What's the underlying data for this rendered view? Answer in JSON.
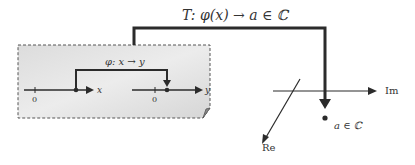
{
  "diagram": {
    "top_map_label": "T:  φ(x) → a ∈ ℂ",
    "inner_map_label": "φ: x → y",
    "x_axis": {
      "label": "x",
      "origin_label": "0"
    },
    "y_axis": {
      "label": "y",
      "origin_label": "0"
    },
    "complex_plane": {
      "real_axis_label": "Re",
      "imag_axis_label": "Im",
      "point_label": "a ∈ ℂ"
    },
    "colors": {
      "line": "#2b2b2b",
      "panel_fill": "#e2e2e2",
      "panel_border": "#555555"
    }
  }
}
